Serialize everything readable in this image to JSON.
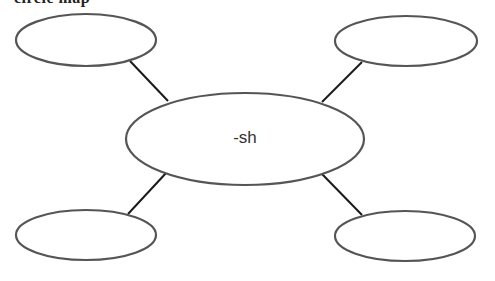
{
  "title_cropped": "circle map",
  "diagram": {
    "type": "spider-map",
    "center": {
      "label": "-sh",
      "cx": 245,
      "cy": 139,
      "rx": 119,
      "ry": 46
    },
    "branches": [
      {
        "id": "top-left",
        "label": "",
        "cx": 86,
        "cy": 40,
        "rx": 70,
        "ry": 26,
        "line": [
          130,
          61,
          168,
          101
        ]
      },
      {
        "id": "top-right",
        "label": "",
        "cx": 406,
        "cy": 41,
        "rx": 71,
        "ry": 25,
        "line": [
          362,
          62,
          322,
          102
        ]
      },
      {
        "id": "bottom-left",
        "label": "",
        "cx": 86,
        "cy": 235,
        "rx": 70,
        "ry": 25,
        "line": [
          128,
          214,
          167,
          172
        ]
      },
      {
        "id": "bottom-right",
        "label": "",
        "cx": 405,
        "cy": 236,
        "rx": 70,
        "ry": 25,
        "line": [
          322,
          174,
          362,
          215
        ]
      }
    ],
    "colors": {
      "node_stroke": "#555555",
      "link": "#1a1a1a",
      "text": "#333333",
      "background": "#ffffff"
    }
  }
}
